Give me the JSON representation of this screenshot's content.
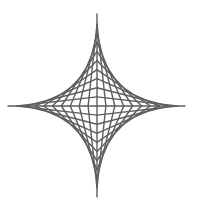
{
  "figure": {
    "width": 198,
    "height": 215,
    "background": "#ffffff",
    "stroke_color": "#5e5e5e",
    "stroke_width": 1.4,
    "center": [
      97,
      106
    ],
    "half_width": 89,
    "half_height": 91,
    "lines_per_quadrant": 10,
    "axes": {
      "horizontal": {
        "x1": 8,
        "y1": 106,
        "x2": 185,
        "y2": 106
      },
      "vertical": {
        "x1": 97,
        "y1": 14,
        "x2": 97,
        "y2": 197
      }
    }
  }
}
